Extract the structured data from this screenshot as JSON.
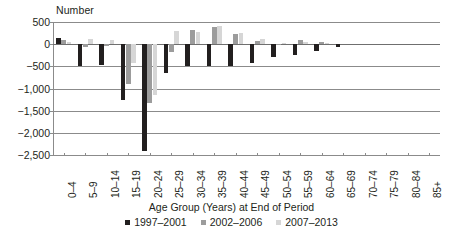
{
  "chart_data": {
    "type": "bar",
    "title": "",
    "ylabel": "Number",
    "xlabel": "Age Group (Years) at End of Period",
    "ylim": [
      -2500,
      500
    ],
    "yticks": [
      500,
      0,
      -500,
      -1000,
      -1500,
      -2000,
      -2500
    ],
    "ytick_labels": [
      "500",
      "0",
      "−500",
      "−1,000",
      "−1,500",
      "−2,000",
      "−2,500"
    ],
    "grid": true,
    "legend_position": "bottom",
    "categories": [
      "0–4",
      "5–9",
      "10–14",
      "15–19",
      "20–24",
      "25–29",
      "30–34",
      "35–39",
      "40–44",
      "45–49",
      "50–54",
      "55–59",
      "60–64",
      "65–69",
      "70–74",
      "75–79",
      "80–84",
      "85+"
    ],
    "series": [
      {
        "name": "1997–2001",
        "color": "#221f1f",
        "values": [
          130,
          -500,
          -460,
          -1260,
          -2400,
          -660,
          -500,
          -500,
          -500,
          -420,
          -300,
          -240,
          -150,
          -70,
          0,
          0,
          0,
          0
        ]
      },
      {
        "name": "2002–2006",
        "color": "#9c9c9c",
        "values": [
          90,
          -60,
          -40,
          -900,
          -1320,
          -170,
          320,
          380,
          230,
          80,
          -30,
          100,
          60,
          0,
          0,
          0,
          0,
          0
        ]
      },
      {
        "name": "2007–2013",
        "color": "#d6d6d6",
        "values": [
          60,
          120,
          90,
          -420,
          -1150,
          290,
          270,
          400,
          250,
          110,
          30,
          40,
          20,
          0,
          0,
          0,
          0,
          0
        ]
      }
    ]
  },
  "legend": {
    "items": [
      {
        "label": "1997–2001"
      },
      {
        "label": "2002–2006"
      },
      {
        "label": "2007–2013"
      }
    ]
  }
}
